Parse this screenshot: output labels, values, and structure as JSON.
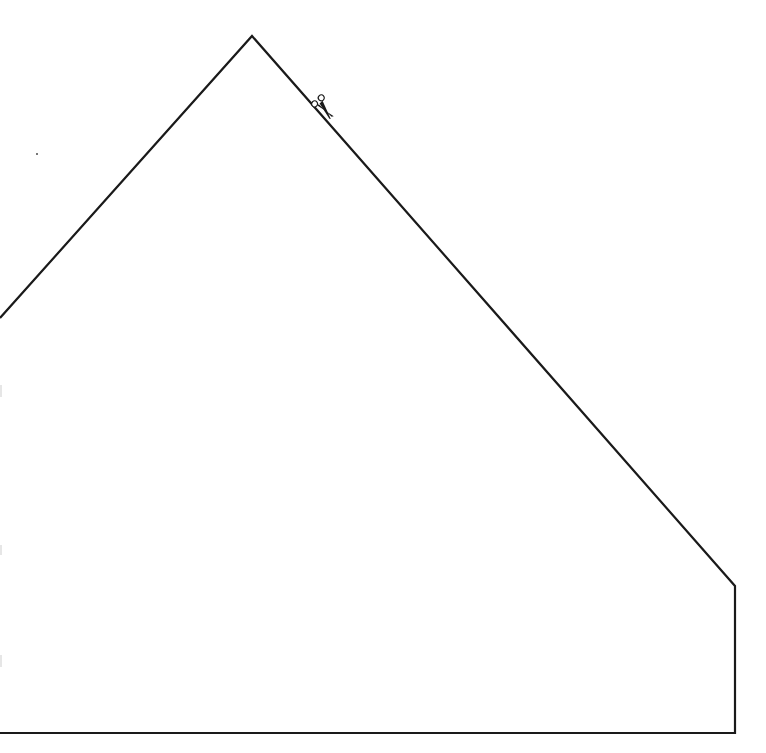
{
  "diagram": {
    "type": "cut-out template",
    "stroke_color": "#1a1a1a",
    "background": "#ffffff",
    "outline_points": [
      [
        0,
        318
      ],
      [
        252,
        36
      ],
      [
        735,
        586
      ],
      [
        735,
        733
      ],
      [
        0,
        733
      ]
    ],
    "stroke_width": 2.2,
    "scissors": {
      "icon": "scissors-icon",
      "x": 325,
      "y": 108,
      "angle": 48
    },
    "stray_dot": {
      "x": 37,
      "y": 154
    }
  }
}
